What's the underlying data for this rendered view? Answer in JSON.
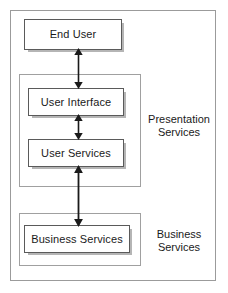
{
  "diagram": {
    "background_color": "#ffffff",
    "frame_color": "#9b9b9b",
    "box_border_color": "#5a5a5a",
    "text_color": "#1a1a1a",
    "nodes": [
      {
        "id": "end-user",
        "label": "End User"
      },
      {
        "id": "user-interface",
        "label": "User Interface"
      },
      {
        "id": "user-services",
        "label": "User Services"
      },
      {
        "id": "business-services",
        "label": "Business Services"
      }
    ],
    "groups": [
      {
        "id": "presentation",
        "label": "Presentation\nServices"
      },
      {
        "id": "business",
        "label": "Business\nServices"
      }
    ],
    "connectors": [
      {
        "id": "end-user-to-user-interface",
        "from": "end-user",
        "to": "user-interface",
        "style": "double-arrow"
      },
      {
        "id": "user-interface-to-user-services",
        "from": "user-interface",
        "to": "user-services",
        "style": "double-arrow"
      },
      {
        "id": "user-services-to-business-services",
        "from": "user-services",
        "to": "business-services",
        "style": "double-arrow"
      }
    ]
  }
}
